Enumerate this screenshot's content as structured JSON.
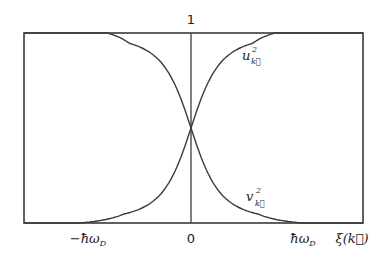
{
  "diagram": {
    "top_label": "1",
    "x_axis_label": "ξ(k⃗)",
    "x_ticks": [
      {
        "value": -1,
        "label": "−ħω",
        "sub": "D"
      },
      {
        "value": 0,
        "label": "0",
        "sub": ""
      },
      {
        "value": 1,
        "label": "ħω",
        "sub": "D"
      }
    ],
    "y_range": [
      0,
      1
    ],
    "x_range": [
      -2.0,
      1.55
    ],
    "curves": [
      {
        "name": "u_k^2",
        "label": "u",
        "sup": "2",
        "sub": "k⃗",
        "behavior": "rises from 0 at −ħω_D to 1 at right",
        "direction": "increasing"
      },
      {
        "name": "v_k^2",
        "label": "v",
        "sup": "2",
        "sub": "k⃗",
        "behavior": "falls from 1 at left to 0 at ħω_D",
        "direction": "decreasing"
      }
    ],
    "crossing_value": 0.5,
    "colors": {
      "line": "#3a3a3a",
      "text": "#222222",
      "background": "#ffffff"
    }
  }
}
